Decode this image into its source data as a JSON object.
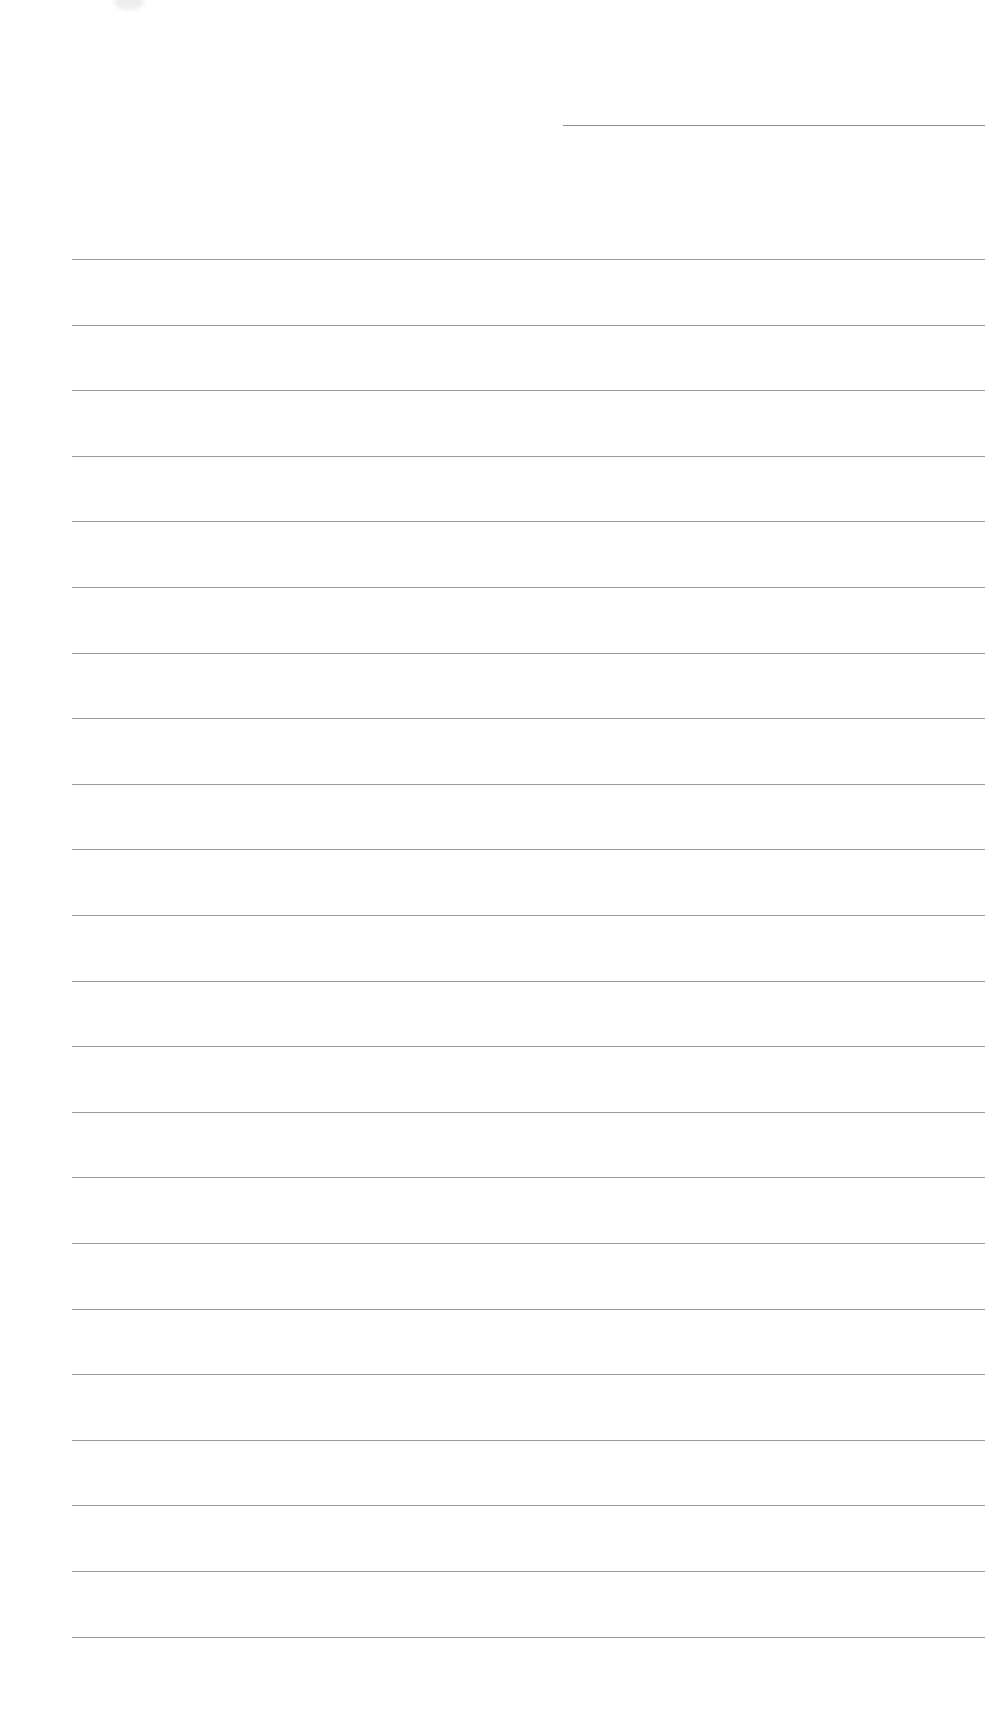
{
  "document": {
    "type": "blank lined paper",
    "background_color": "#ffffff",
    "line_color": "#9a9a9a",
    "header_line": {
      "label": "name/date line",
      "x_start": 563,
      "x_end": 985,
      "y": 125
    },
    "ruled_lines": {
      "count": 22,
      "x_start": 72,
      "x_end": 985,
      "first_y": 259,
      "spacing": 65.6
    }
  }
}
